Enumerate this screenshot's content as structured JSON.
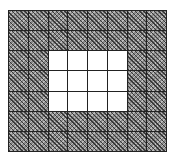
{
  "diagram": {
    "type": "grid",
    "rows": 7,
    "cols": 8,
    "colors": {
      "shaded": "#8a8a8a",
      "white": "#ffffff",
      "line": "#222222"
    },
    "white_region": {
      "row_start": 2,
      "row_end": 4,
      "col_start": 2,
      "col_end": 5
    },
    "cells": [
      [
        "shaded",
        "shaded",
        "shaded",
        "shaded",
        "shaded",
        "shaded",
        "shaded",
        "shaded"
      ],
      [
        "shaded",
        "shaded",
        "shaded",
        "shaded",
        "shaded",
        "shaded",
        "shaded",
        "shaded"
      ],
      [
        "shaded",
        "shaded",
        "white",
        "white",
        "white",
        "white",
        "shaded",
        "shaded"
      ],
      [
        "shaded",
        "shaded",
        "white",
        "white",
        "white",
        "white",
        "shaded",
        "shaded"
      ],
      [
        "shaded",
        "shaded",
        "white",
        "white",
        "white",
        "white",
        "shaded",
        "shaded"
      ],
      [
        "shaded",
        "shaded",
        "shaded",
        "shaded",
        "shaded",
        "shaded",
        "shaded",
        "shaded"
      ],
      [
        "shaded",
        "shaded",
        "shaded",
        "shaded",
        "shaded",
        "shaded",
        "shaded",
        "shaded"
      ]
    ]
  }
}
